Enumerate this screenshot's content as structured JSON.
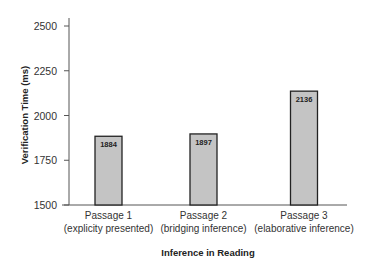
{
  "chart_data": {
    "type": "bar",
    "title": "",
    "xlabel": "Inference in Reading",
    "ylabel": "Verification Time (ms)",
    "ylim": [
      1500,
      2500
    ],
    "yticks": [
      1500,
      1750,
      2000,
      2250,
      2500
    ],
    "categories": [
      {
        "line1": "Passage 1",
        "line2": "(explicity presented)"
      },
      {
        "line1": "Passage 2",
        "line2": "(bridging inference)"
      },
      {
        "line1": "Passage 3",
        "line2": "(elaborative inference)"
      }
    ],
    "values": [
      1884,
      1897,
      2136
    ],
    "value_labels": [
      "1884",
      "1897",
      "2136"
    ],
    "grid": false,
    "legend": null,
    "bar_color": "#c4c4c4",
    "bar_edge_color": "#222222"
  }
}
